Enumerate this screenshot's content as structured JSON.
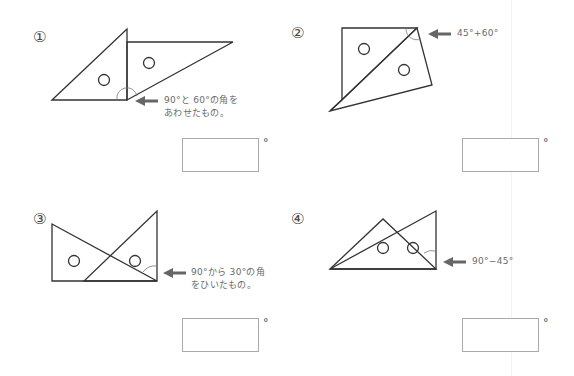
{
  "problems": [
    {
      "number": "①",
      "hint_lines": [
        "90°と 60°の角を",
        "あわせたもの。"
      ],
      "answer_value": "",
      "unit": "°"
    },
    {
      "number": "②",
      "hint_lines": [
        "45°+60°"
      ],
      "answer_value": "",
      "unit": "°"
    },
    {
      "number": "③",
      "hint_lines": [
        "90°から 30°の角",
        "をひいたもの。"
      ],
      "answer_value": "",
      "unit": "°"
    },
    {
      "number": "④",
      "hint_lines": [
        "90°−45°"
      ],
      "answer_value": "",
      "unit": "°"
    }
  ],
  "colors": {
    "line": "#333333",
    "arrow": "#666666",
    "hint_text": "#6a6a6a",
    "box_border": "#aaaaaa"
  }
}
